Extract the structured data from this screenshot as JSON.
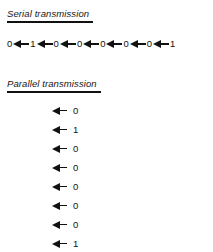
{
  "figure": {
    "background_color": "#ffffff",
    "ink_color": "#111111"
  },
  "serial": {
    "heading": "Serial transmission",
    "bits": [
      "0",
      "1",
      "0",
      "0",
      "0",
      "0",
      "0",
      "1"
    ],
    "arrow_direction": "left",
    "arrow_count": 7
  },
  "parallel": {
    "heading": "Parallel transmission",
    "bits": [
      "0",
      "1",
      "0",
      "0",
      "0",
      "0",
      "0",
      "1"
    ],
    "arrow_direction": "left",
    "arrow_count": 8
  }
}
